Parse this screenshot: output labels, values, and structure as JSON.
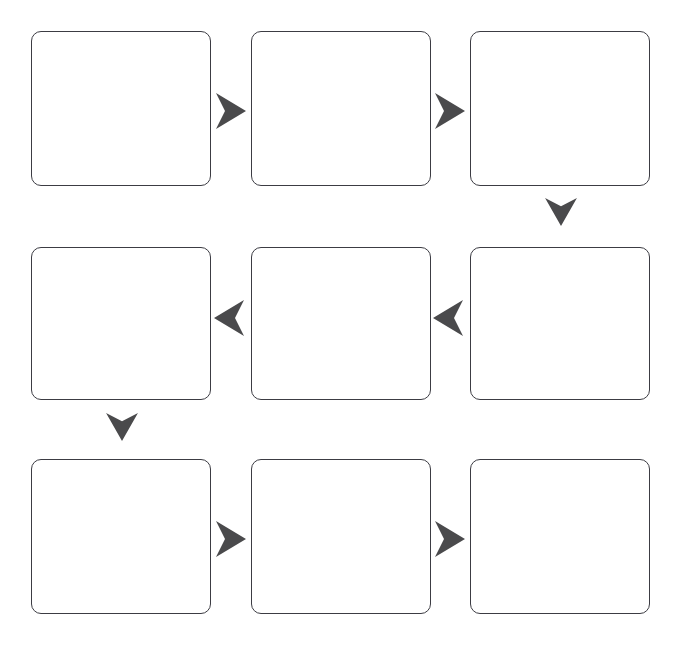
{
  "diagram": {
    "type": "flowchart",
    "title": "",
    "layout": "serpentine-grid",
    "rows": 3,
    "columns": 3,
    "canvas": {
      "width": 678,
      "height": 651
    },
    "background_color": "#ffffff",
    "box_style": {
      "fill_color": "#ffffff",
      "border_color": "#3c3c43",
      "border_width": 1,
      "corner_radius": 10,
      "width": 180,
      "height": 155
    },
    "arrow_style": {
      "fill_color": "#4a4a4c",
      "shape": "concave-arrowhead"
    },
    "boxes": [
      {
        "id": "box-1",
        "label": "",
        "row": 1,
        "column": 1,
        "x": 31,
        "y": 31,
        "width": 180,
        "height": 155
      },
      {
        "id": "box-2",
        "label": "",
        "row": 1,
        "column": 2,
        "x": 251,
        "y": 31,
        "width": 180,
        "height": 155
      },
      {
        "id": "box-3",
        "label": "",
        "row": 1,
        "column": 3,
        "x": 470,
        "y": 31,
        "width": 180,
        "height": 155
      },
      {
        "id": "box-4",
        "label": "",
        "row": 2,
        "column": 1,
        "x": 31,
        "y": 247,
        "width": 180,
        "height": 153
      },
      {
        "id": "box-5",
        "label": "",
        "row": 2,
        "column": 2,
        "x": 251,
        "y": 247,
        "width": 180,
        "height": 153
      },
      {
        "id": "box-6",
        "label": "",
        "row": 2,
        "column": 3,
        "x": 470,
        "y": 247,
        "width": 180,
        "height": 153
      },
      {
        "id": "box-7",
        "label": "",
        "row": 3,
        "column": 1,
        "x": 31,
        "y": 459,
        "width": 180,
        "height": 155
      },
      {
        "id": "box-8",
        "label": "",
        "row": 3,
        "column": 2,
        "x": 251,
        "y": 459,
        "width": 180,
        "height": 155
      },
      {
        "id": "box-9",
        "label": "",
        "row": 3,
        "column": 3,
        "x": 470,
        "y": 459,
        "width": 180,
        "height": 155
      }
    ],
    "arrows": [
      {
        "id": "arrow-1",
        "label": "",
        "from": "box-1",
        "to": "box-2",
        "direction": "right",
        "x": 214,
        "y": 93,
        "width": 32,
        "height": 36
      },
      {
        "id": "arrow-2",
        "label": "",
        "from": "box-2",
        "to": "box-3",
        "direction": "right",
        "x": 433,
        "y": 93,
        "width": 32,
        "height": 36
      },
      {
        "id": "arrow-3",
        "label": "",
        "from": "box-3",
        "to": "box-6",
        "direction": "down",
        "x": 544,
        "y": 196,
        "width": 34,
        "height": 30
      },
      {
        "id": "arrow-4",
        "label": "",
        "from": "box-6",
        "to": "box-5",
        "direction": "left",
        "x": 433,
        "y": 300,
        "width": 32,
        "height": 36
      },
      {
        "id": "arrow-5",
        "label": "",
        "from": "box-5",
        "to": "box-4",
        "direction": "left",
        "x": 214,
        "y": 300,
        "width": 32,
        "height": 36
      },
      {
        "id": "arrow-6",
        "label": "",
        "from": "box-4",
        "to": "box-7",
        "direction": "down",
        "x": 105,
        "y": 411,
        "width": 34,
        "height": 30
      },
      {
        "id": "arrow-7",
        "label": "",
        "from": "box-7",
        "to": "box-8",
        "direction": "right",
        "x": 214,
        "y": 521,
        "width": 32,
        "height": 36
      },
      {
        "id": "arrow-8",
        "label": "",
        "from": "box-8",
        "to": "box-9",
        "direction": "right",
        "x": 433,
        "y": 521,
        "width": 32,
        "height": 36
      }
    ]
  }
}
